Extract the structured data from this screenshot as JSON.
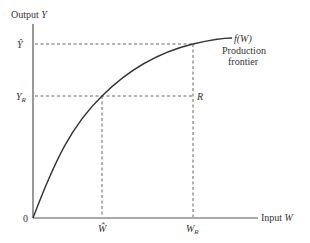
{
  "diagram": {
    "title": "Production frontier",
    "axes": {
      "y_label": "Output",
      "y_var": "Y",
      "x_label": "Input",
      "x_var": "W",
      "origin_label": "0"
    },
    "curve": {
      "label_fn": "f(W)",
      "label_line1": "Production",
      "label_line2": "frontier"
    },
    "y_ticks": {
      "y_hat": "Ŷ",
      "y_r_main": "Y",
      "y_r_sub": "R"
    },
    "x_ticks": {
      "w_hat": "Ŵ",
      "w_r_main": "W",
      "w_r_sub": "R"
    },
    "point_label": "R",
    "colors": {
      "axis": "#555555",
      "curve": "#333333",
      "dashed": "#555555",
      "text": "#333333"
    }
  }
}
